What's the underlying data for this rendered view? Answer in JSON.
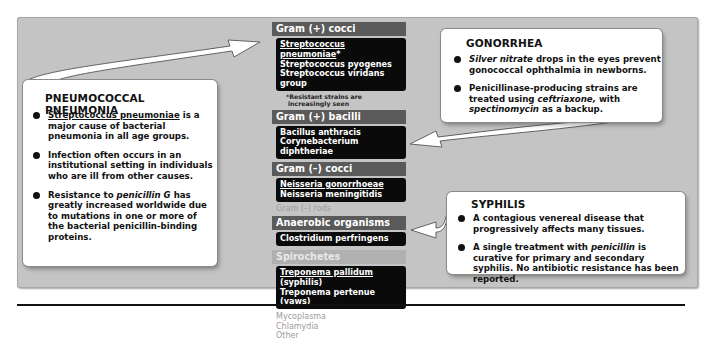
{
  "colors": {
    "panel_bg": "#c4c4c4",
    "header_dark": "#5a5a5a",
    "header_light": "#b0b0b0",
    "organism_box": "#0a0a0a",
    "faint_text": "#9c9c9c",
    "callout_bg": "#ffffff"
  },
  "center_column": {
    "gram_pos_cocci": {
      "header": "Gram (+) cocci",
      "items": [
        "Streptococcus pneumoniae",
        "Streptococcus pyogenes",
        "Streptococcus viridans group"
      ],
      "asterisk": "*",
      "note_line1": "*Resistant strains are",
      "note_line2": "increasingly seen"
    },
    "gram_pos_bacilli": {
      "header": "Gram (+) bacilli",
      "items": [
        "Bacillus anthracis",
        "Corynebacterium diphtheriae"
      ]
    },
    "gram_neg_cocci": {
      "header": "Gram (–) cocci",
      "items": [
        "Neisseria gonorrhoeae",
        "Neisseria meningitidis"
      ]
    },
    "gram_neg_rods": "Gram (–) rods",
    "anaerobic": {
      "header": "Anaerobic organisms",
      "items": [
        "Clostridium perfringens"
      ]
    },
    "spirochetes": {
      "header": "Spirochetes",
      "item1_name": "Treponema pallidum",
      "item1_suffix": " (syphilis)",
      "item2": "Treponema pertenue (yaws)"
    },
    "faint_items": [
      "Mycoplasma",
      "Chlamydia",
      "Other"
    ]
  },
  "pneumococcal": {
    "title": "PNEUMOCOCCAL PNEUMONIA",
    "b1_organism": "Streptococcus pneumoniae",
    "b1_rest": " is a major cause of bacterial pneumonia in all age groups.",
    "b2": "Infection often occurs in an institutional setting in individuals who are ill from other causes.",
    "b3_pre": "Resistance to ",
    "b3_drug": "penicillin G",
    "b3_post": " has greatly increased worldwide due to mutations in one or more of the bacterial penicillin-binding proteins."
  },
  "gonorrhea": {
    "title": "GONORRHEA",
    "b1_drug": "Silver nitrate",
    "b1_rest": " drops in the eyes prevent gonococcal ophthalmia in newborns.",
    "b2_pre": "Penicillinase-producing strains are treated using ",
    "b2_drug1": "ceftriaxone,",
    "b2_mid": " with ",
    "b2_drug2": "spectinomycin",
    "b2_post": " as a backup."
  },
  "syphilis": {
    "title": "SYPHILIS",
    "b1": "A contagious venereal disease that progressively affects many tissues.",
    "b2_pre": "A single treatment with ",
    "b2_drug": "penicillin",
    "b2_post": " is curative for primary and secondary syphilis. No antibiotic resistance has been reported."
  }
}
